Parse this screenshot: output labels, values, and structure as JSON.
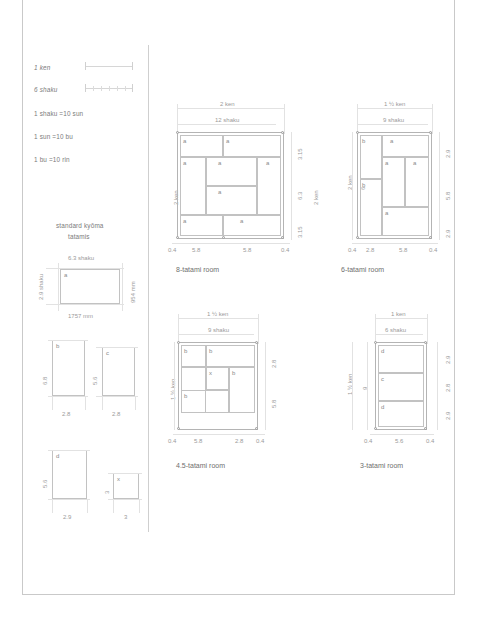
{
  "legend": {
    "scale_rows": [
      {
        "label": "1 ken",
        "divisions": 1,
        "icon": "scale-bar-icon"
      },
      {
        "label": "6 shaku",
        "divisions": 6,
        "icon": "scale-bar-icon"
      }
    ],
    "conversions": [
      "1 shaku =10 sun",
      "1 sun =10 bu",
      "1 bu =10 rin"
    ]
  },
  "standard_tatami": {
    "heading_line1": "standard kyōma",
    "heading_line2": "tatamis",
    "mat_label": "a",
    "dim_top": "6.3 shaku",
    "dim_left": "2.9 shaku",
    "dim_right": "954 mm",
    "dim_bottom": "1757 mm"
  },
  "partial_mats": [
    {
      "label": "b",
      "width_dim": "2.8",
      "height_dim": "6.8"
    },
    {
      "label": "c",
      "width_dim": "2.8",
      "height_dim": "5.6"
    },
    {
      "label": "d",
      "width_dim": "2.9",
      "height_dim": "5.6"
    },
    {
      "label": "x",
      "width_dim": "3",
      "height_dim": "3"
    }
  ],
  "rooms": [
    {
      "id": "room-8-tatami",
      "caption": "8-tatami room",
      "top_dim_ken": "2 ken",
      "top_dim_shaku": "12 shaku",
      "left_dim_ken": "2 ken",
      "right_dim_ken": "2 ken",
      "bottom_dims": [
        "0.4",
        "5.8",
        "5.8",
        "0.4"
      ],
      "right_dims": [
        "3.15",
        "6.3",
        "3.15"
      ],
      "mats": [
        "a",
        "a",
        "a",
        "a",
        "a",
        "a",
        "a",
        "a"
      ]
    },
    {
      "id": "room-6-tatami",
      "caption": "6-tatami room",
      "top_dim_ken": "1 ½ ken",
      "top_dim_shaku": "9 shaku",
      "left_dim_ken": "2 ken",
      "left_dim_shaku": "6",
      "bottom_dims": [
        "0.4",
        "2.8",
        "5.8",
        "0.4"
      ],
      "right_dims": [
        "2.9",
        "5.8",
        "2.9"
      ],
      "mats": [
        "b",
        "a",
        "a",
        "a",
        "b",
        "a"
      ]
    },
    {
      "id": "room-4-5-tatami",
      "caption": "4.5-tatami room",
      "top_dim_ken": "1 ½ ken",
      "top_dim_shaku": "9 shaku",
      "left_dim_ken": "1 ½ ken",
      "bottom_dims": [
        "0.4",
        "5.8",
        "2.8",
        "0.4"
      ],
      "right_dims": [
        "2.8",
        "5.8"
      ],
      "mats": [
        "b",
        "b",
        "x",
        "b",
        "b"
      ]
    },
    {
      "id": "room-3-tatami",
      "caption": "3-tatami room",
      "top_dim_ken": "1 ken",
      "top_dim_shaku": "6 shaku",
      "left_dim_ken": "1 ½ ken",
      "left_dim_shaku": "9",
      "bottom_dims": [
        "0.4",
        "5.6",
        "0.4"
      ],
      "right_dims": [
        "2.9",
        "2.8",
        "2.9"
      ],
      "mats": [
        "d",
        "c",
        "d"
      ]
    }
  ],
  "colors": {
    "line": "#c2c2c2",
    "wall": "#b4b4b4",
    "text": "#7b7b7b",
    "dim_text": "#9a9a9a",
    "frame": "#c9c9c9"
  }
}
